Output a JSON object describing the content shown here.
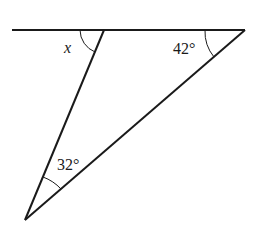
{
  "diagram": {
    "type": "geometry-triangle",
    "line": {
      "x1": 12,
      "y1": 30,
      "x2": 245,
      "y2": 30
    },
    "vertices": {
      "A": {
        "x": 104,
        "y": 30
      },
      "B": {
        "x": 245,
        "y": 30
      },
      "C": {
        "x": 25,
        "y": 220
      }
    },
    "labels": {
      "x_angle": "x",
      "angle_B": "42°",
      "angle_C": "32°"
    },
    "stroke_color": "#1a1a1a"
  }
}
